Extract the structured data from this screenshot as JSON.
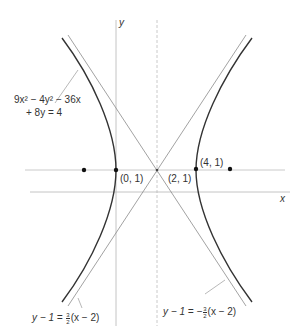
{
  "diagram": {
    "type": "hyperbola-graph",
    "axes": {
      "x_label": "x",
      "y_label": "y"
    },
    "equation": {
      "line1": "9x² − 4y² − 36x",
      "line2": "+ 8y = 4"
    },
    "points": [
      {
        "label": "(0, 1)",
        "role": "vertex"
      },
      {
        "label": "(2, 1)",
        "role": "center"
      },
      {
        "label": "(4, 1)",
        "role": "vertex"
      }
    ],
    "foci_count": 2,
    "asymptotes": [
      {
        "lhs": "y − 1 = ",
        "frac_num": "3",
        "frac_den": "2",
        "rhs": "(x − 2)"
      },
      {
        "lhs": "y − 1 = −",
        "frac_num": "3",
        "frac_den": "2",
        "rhs": "(x − 2)"
      }
    ]
  },
  "colors": {
    "curve": "#333333",
    "asymptote": "#8a8a8a",
    "axis": "#b0b0b0",
    "text": "#333333"
  }
}
